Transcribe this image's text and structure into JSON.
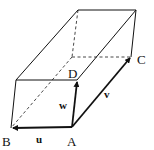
{
  "diagram": {
    "type": "parallelepiped",
    "vertices": {
      "A": {
        "label": "A",
        "x": 72,
        "y": 127
      },
      "B": {
        "label": "B",
        "x": 11,
        "y": 128
      },
      "C": {
        "label": "C",
        "x": 131,
        "y": 57
      },
      "D": {
        "label": "D",
        "x": 77,
        "y": 80
      }
    },
    "vectors": [
      {
        "name": "u",
        "label": "u",
        "from": "A",
        "to": "B"
      },
      {
        "name": "v",
        "label": "v",
        "from": "A",
        "to": "C"
      },
      {
        "name": "w",
        "label": "w",
        "from": "A",
        "to": "D"
      }
    ],
    "labels": {
      "A": "A",
      "B": "B",
      "C": "C",
      "D": "D",
      "u": "u",
      "v": "v",
      "w": "w"
    },
    "colors": {
      "stroke": "#111111",
      "background": "#ffffff"
    }
  }
}
